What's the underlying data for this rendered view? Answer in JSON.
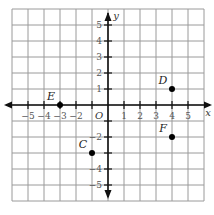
{
  "chart_data": {
    "type": "scatter",
    "title": "",
    "xlabel": "x",
    "ylabel": "y",
    "origin_label": "O",
    "xlim": [
      -6,
      6
    ],
    "ylim": [
      -6,
      6
    ],
    "grid": true,
    "x_ticks": [
      -5,
      -4,
      -3,
      -2,
      1,
      2,
      3,
      4,
      5
    ],
    "x_tick_labels": [
      "−5",
      "−4",
      "−3",
      "−2",
      "1",
      "2",
      "3",
      "4",
      "5"
    ],
    "y_ticks": [
      5,
      4,
      3,
      2,
      1,
      -2,
      -4,
      -5
    ],
    "y_tick_labels": [
      "5",
      "4",
      "3",
      "2",
      "1",
      "−2",
      "−4",
      "−5"
    ],
    "points": [
      {
        "label": "E",
        "x": -3,
        "y": 0
      },
      {
        "label": "D",
        "x": 4,
        "y": 1
      },
      {
        "label": "C",
        "x": -1,
        "y": -3
      },
      {
        "label": "F",
        "x": 4,
        "y": -2
      }
    ],
    "colors": {
      "grid": "#9a9a9a",
      "axis": "#111111",
      "point": "#000000",
      "text": "#555555"
    }
  }
}
